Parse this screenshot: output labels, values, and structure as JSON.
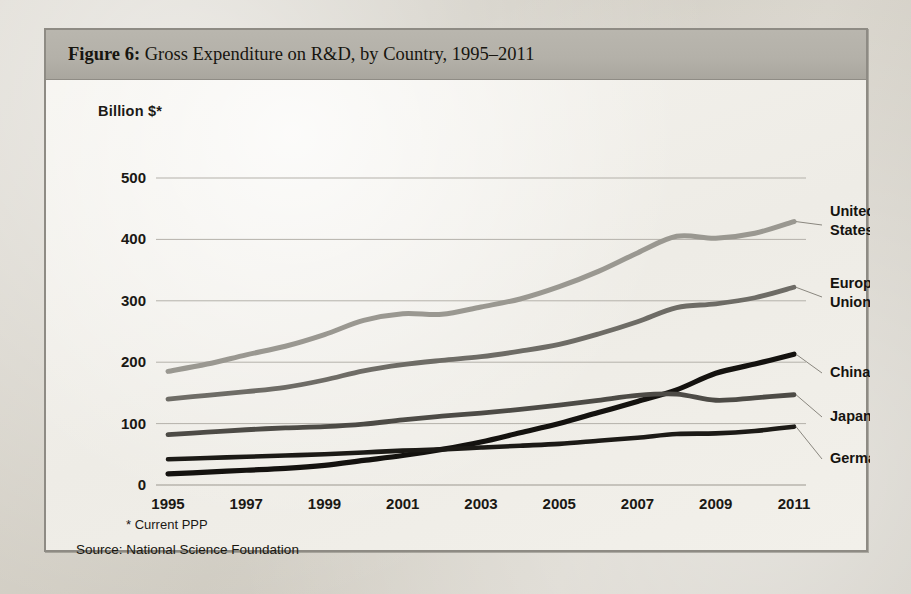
{
  "figure": {
    "title_lead": "Figure 6:",
    "title_rest": "Gross Expenditure on R&D, by Country, 1995–2011",
    "y_axis_label": "Billion $*",
    "footnote": "* Current PPP",
    "source": "Source: National Science Foundation"
  },
  "page_bleed_text": "ing do after be beyond the s of all. Communicating on\n n, knowledge, technology from research and and\n communities. Graduate education is\n s essential to research. Changing the same modality\n\n scenes. The aim of a learning system is to see in\n a or more, and can still record the same future endeavor\n of the new environment\n\n\n counter regulated educational limits  that sees work\n   a count agents every of a part with their\n   time-scale. Make a summary consistent.",
  "chart_data": {
    "type": "line",
    "title": "Gross Expenditure on R&D, by Country, 1995–2011",
    "xlabel": "",
    "ylabel": "Billion $*",
    "ylim": [
      0,
      500
    ],
    "yticks": [
      0,
      100,
      200,
      300,
      400,
      500
    ],
    "xlim": [
      1995,
      2011
    ],
    "xticks": [
      1995,
      1997,
      1999,
      2001,
      2003,
      2005,
      2007,
      2009,
      2011
    ],
    "x": [
      1995,
      1996,
      1997,
      1998,
      1999,
      2000,
      2001,
      2002,
      2003,
      2004,
      2005,
      2006,
      2007,
      2008,
      2009,
      2010,
      2011
    ],
    "grid": true,
    "legend_position": "right-of-lines",
    "series": [
      {
        "name": "United States",
        "color": "#9a9891",
        "width": 5.0,
        "label_lines": [
          "United",
          "States"
        ],
        "values": [
          185,
          197,
          212,
          226,
          245,
          268,
          279,
          278,
          290,
          303,
          323,
          348,
          378,
          405,
          402,
          410,
          429
        ]
      },
      {
        "name": "European Union",
        "color": "#6e6c66",
        "width": 4.8,
        "label_lines": [
          "European",
          "Union"
        ],
        "values": [
          140,
          146,
          152,
          159,
          171,
          186,
          196,
          203,
          209,
          218,
          229,
          246,
          266,
          289,
          295,
          305,
          322
        ]
      },
      {
        "name": "China",
        "color": "#14120f",
        "width": 5.2,
        "label_lines": [
          "China"
        ],
        "values": [
          18,
          21,
          24,
          27,
          32,
          40,
          48,
          58,
          70,
          85,
          100,
          118,
          136,
          155,
          182,
          197,
          213
        ]
      },
      {
        "name": "Japan",
        "color": "#4d4b46",
        "width": 4.8,
        "label_lines": [
          "Japan"
        ],
        "values": [
          82,
          86,
          90,
          93,
          95,
          99,
          106,
          112,
          117,
          123,
          130,
          138,
          146,
          148,
          138,
          142,
          147
        ]
      },
      {
        "name": "Germany",
        "color": "#1c1a16",
        "width": 4.6,
        "label_lines": [
          "Germany"
        ],
        "values": [
          42,
          44,
          46,
          48,
          50,
          53,
          56,
          58,
          61,
          64,
          67,
          72,
          77,
          83,
          84,
          88,
          95
        ]
      }
    ]
  },
  "legend": {
    "items": [
      {
        "label": "United States",
        "color": "#9a9891"
      },
      {
        "label": "European Union",
        "color": "#6e6c66"
      },
      {
        "label": "China",
        "color": "#14120f"
      },
      {
        "label": "Japan",
        "color": "#4d4b46"
      },
      {
        "label": "Germany",
        "color": "#1c1a16"
      }
    ]
  }
}
